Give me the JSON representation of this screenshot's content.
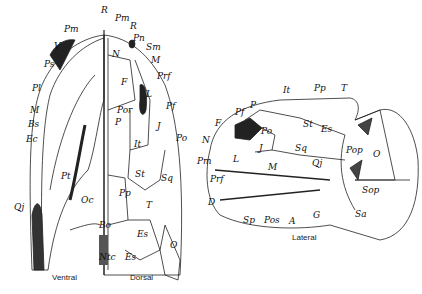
{
  "figure": {
    "captions": {
      "ventral": "Ventral",
      "dorsal": "Dorsal",
      "lateral": "Lateral"
    },
    "ventral_dorsal_labels": [
      {
        "id": "R-top",
        "text": "R",
        "x": 104,
        "y": 13
      },
      {
        "id": "Pm-left",
        "text": "Pm",
        "x": 67,
        "y": 30
      },
      {
        "id": "Pm-right",
        "text": "Pm",
        "x": 117,
        "y": 20
      },
      {
        "id": "R-right",
        "text": "R",
        "x": 131,
        "y": 28
      },
      {
        "id": "Pn",
        "text": "Pn",
        "x": 134,
        "y": 40
      },
      {
        "id": "V",
        "text": "V",
        "x": 55,
        "y": 47
      },
      {
        "id": "Sm",
        "text": "Sm",
        "x": 146,
        "y": 48
      },
      {
        "id": "N",
        "text": "N",
        "x": 111,
        "y": 55
      },
      {
        "id": "M-right",
        "text": "M",
        "x": 146,
        "y": 60
      },
      {
        "id": "Ps",
        "text": "Ps",
        "x": 44,
        "y": 64
      },
      {
        "id": "Prf",
        "text": "Prf",
        "x": 159,
        "y": 75
      },
      {
        "id": "F",
        "text": "F",
        "x": 120,
        "y": 79
      },
      {
        "id": "Pl",
        "text": "Pl",
        "x": 32,
        "y": 87
      },
      {
        "id": "L",
        "text": "L",
        "x": 145,
        "y": 91
      },
      {
        "id": "Pf",
        "text": "Pf",
        "x": 165,
        "y": 103
      },
      {
        "id": "Por",
        "text": "Por",
        "x": 116,
        "y": 107
      },
      {
        "id": "M-left",
        "text": "M",
        "x": 30,
        "y": 108
      },
      {
        "id": "P",
        "text": "P",
        "x": 115,
        "y": 118
      },
      {
        "id": "Bs",
        "text": "Bs",
        "x": 28,
        "y": 122
      },
      {
        "id": "J",
        "text": "J",
        "x": 155,
        "y": 124
      },
      {
        "id": "Ec",
        "text": "Ec",
        "x": 26,
        "y": 137
      },
      {
        "id": "Po",
        "text": "Po",
        "x": 175,
        "y": 134
      },
      {
        "id": "It",
        "text": "It",
        "x": 134,
        "y": 141
      },
      {
        "id": "Pt",
        "text": "Pt",
        "x": 60,
        "y": 174
      },
      {
        "id": "St",
        "text": "St",
        "x": 136,
        "y": 171
      },
      {
        "id": "Sq",
        "text": "Sq",
        "x": 160,
        "y": 175
      },
      {
        "id": "Oc",
        "text": "Oc",
        "x": 80,
        "y": 198
      },
      {
        "id": "Pp",
        "text": "Pp",
        "x": 118,
        "y": 190
      },
      {
        "id": "Qj",
        "text": "Qj",
        "x": 14,
        "y": 205
      },
      {
        "id": "T",
        "text": "T",
        "x": 145,
        "y": 203
      },
      {
        "id": "Bo",
        "text": "Bo",
        "x": 99,
        "y": 222
      },
      {
        "id": "Es-dorsal",
        "text": "Es",
        "x": 136,
        "y": 231
      },
      {
        "id": "O-dorsal",
        "text": "O",
        "x": 170,
        "y": 242
      },
      {
        "id": "Ntc",
        "text": "Ntc",
        "x": 98,
        "y": 253
      },
      {
        "id": "Es-lower",
        "text": "Es",
        "x": 125,
        "y": 253
      }
    ],
    "lateral_labels": [
      {
        "id": "It",
        "text": "It",
        "x": 283,
        "y": 97
      },
      {
        "id": "Pp",
        "text": "Pp",
        "x": 314,
        "y": 93
      },
      {
        "id": "T",
        "text": "T",
        "x": 338,
        "y": 93
      },
      {
        "id": "P",
        "text": "P",
        "x": 250,
        "y": 104
      },
      {
        "id": "Pf",
        "text": "Pf",
        "x": 235,
        "y": 110
      },
      {
        "id": "F",
        "text": "F",
        "x": 215,
        "y": 121
      },
      {
        "id": "St",
        "text": "St",
        "x": 302,
        "y": 119
      },
      {
        "id": "Es",
        "text": "Es",
        "x": 328,
        "y": 124
      },
      {
        "id": "Po",
        "text": "Po",
        "x": 261,
        "y": 129
      },
      {
        "id": "N",
        "text": "N",
        "x": 202,
        "y": 138
      },
      {
        "id": "Sq",
        "text": "Sq",
        "x": 297,
        "y": 145
      },
      {
        "id": "J",
        "text": "J",
        "x": 259,
        "y": 145
      },
      {
        "id": "Pop",
        "text": "Pop",
        "x": 347,
        "y": 147
      },
      {
        "id": "O",
        "text": "O",
        "x": 370,
        "y": 150
      },
      {
        "id": "Pm",
        "text": "Pm",
        "x": 199,
        "y": 157
      },
      {
        "id": "L",
        "text": "L",
        "x": 233,
        "y": 157
      },
      {
        "id": "Qj",
        "text": "Qj",
        "x": 312,
        "y": 160
      },
      {
        "id": "M",
        "text": "M",
        "x": 268,
        "y": 163
      },
      {
        "id": "Prf",
        "text": "Prf",
        "x": 211,
        "y": 172
      },
      {
        "id": "Sop",
        "text": "Sop",
        "x": 364,
        "y": 188
      },
      {
        "id": "D",
        "text": "D",
        "x": 208,
        "y": 200
      },
      {
        "id": "Sa",
        "text": "Sa",
        "x": 357,
        "y": 210
      },
      {
        "id": "G",
        "text": "G",
        "x": 314,
        "y": 212
      },
      {
        "id": "Sp",
        "text": "Sp",
        "x": 243,
        "y": 219
      },
      {
        "id": "Pos",
        "text": "Pos",
        "x": 266,
        "y": 218
      },
      {
        "id": "A",
        "text": "A",
        "x": 289,
        "y": 219
      }
    ]
  }
}
